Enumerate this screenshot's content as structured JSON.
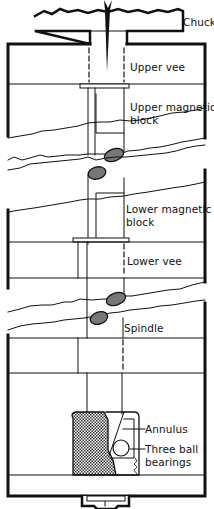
{
  "diagram": {
    "type": "technical-cross-section",
    "colors": {
      "line": "#111111",
      "background": "#ffffff",
      "hatch": "#333333",
      "shading": "#777777"
    },
    "labels": {
      "chuck": "Chuck",
      "upper_vee": "Upper vee",
      "upper_magnetic_block_1": "Upper magnetic",
      "upper_magnetic_block_2": "block",
      "lower_magnetic_block_1": "Lower magnetic",
      "lower_magnetic_block_2": "block",
      "lower_vee": "Lower vee",
      "spindle": "Spindle",
      "annulus": "Annulus",
      "three_ball_bearings_1": "Three ball",
      "three_ball_bearings_2": "bearings"
    }
  }
}
